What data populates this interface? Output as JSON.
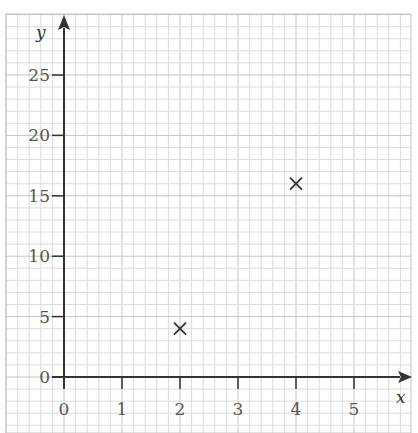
{
  "chart_data": {
    "type": "scatter",
    "title": "",
    "xlabel": "x",
    "ylabel": "y",
    "xlim": [
      0,
      5.8
    ],
    "ylim": [
      0,
      29
    ],
    "grid": true,
    "x_ticks": [
      0,
      1,
      2,
      3,
      4,
      5
    ],
    "y_ticks": [
      0,
      5,
      10,
      15,
      20,
      25
    ],
    "x_tick_labels": [
      "0",
      "1",
      "2",
      "3",
      "4",
      "5"
    ],
    "y_tick_labels": [
      "0",
      "5",
      "10",
      "15",
      "20",
      "25"
    ],
    "marker": "x",
    "points": [
      {
        "x": 2,
        "y": 4
      },
      {
        "x": 4,
        "y": 16
      }
    ],
    "legend": null
  },
  "colors": {
    "grid_minor": "#dcdcdc",
    "grid_major": "#c4c4c4",
    "axis": "#333333",
    "marker": "#333333"
  }
}
